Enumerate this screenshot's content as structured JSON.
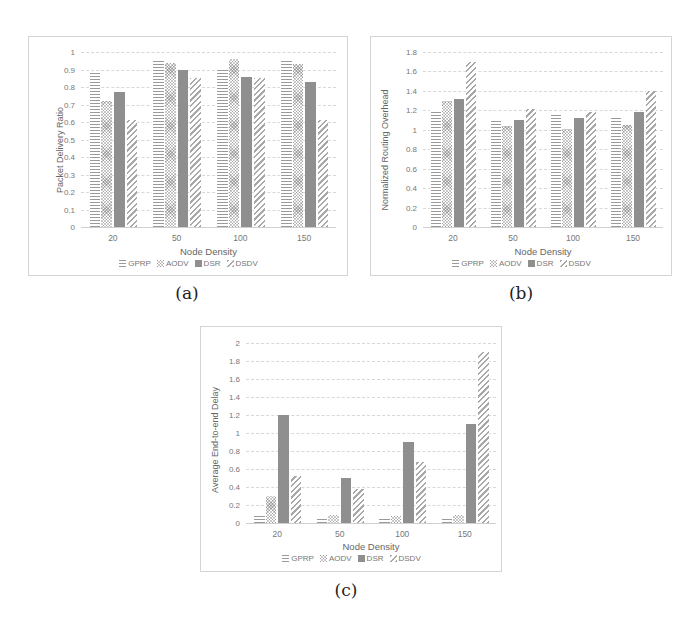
{
  "figure": {
    "captions": [
      "(a)",
      "(b)",
      "(c)"
    ]
  },
  "legend": {
    "items": [
      "GPRP",
      "AODV",
      "DSR",
      "DSDV"
    ]
  },
  "chart_data": [
    {
      "type": "bar",
      "title": "",
      "panel_label": "(a)",
      "xlabel": "Node Density",
      "ylabel": "Packet Delivery Ratio",
      "categories": [
        "20",
        "50",
        "100",
        "150"
      ],
      "ylim": [
        0,
        1
      ],
      "yticks": [
        "0",
        "0.1",
        "0.2",
        "0.3",
        "0.4",
        "0.5",
        "0.6",
        "0.7",
        "0.8",
        "0.9",
        "1"
      ],
      "grid": true,
      "legend_position": "bottom",
      "series": [
        {
          "name": "GPRP",
          "values": [
            0.89,
            0.95,
            0.91,
            0.95
          ]
        },
        {
          "name": "AODV",
          "values": [
            0.72,
            0.94,
            0.96,
            0.93
          ]
        },
        {
          "name": "DSR",
          "values": [
            0.77,
            0.9,
            0.86,
            0.83
          ]
        },
        {
          "name": "DSDV",
          "values": [
            0.61,
            0.85,
            0.85,
            0.61
          ]
        }
      ]
    },
    {
      "type": "bar",
      "title": "",
      "panel_label": "(b)",
      "xlabel": "Node Density",
      "ylabel": "Normalized Routing Overhead",
      "categories": [
        "20",
        "50",
        "100",
        "150"
      ],
      "ylim": [
        0,
        1.8
      ],
      "yticks": [
        "0",
        "0.2",
        "0.4",
        "0.6",
        "0.8",
        "1",
        "1.2",
        "1.4",
        "1.6",
        "1.8"
      ],
      "grid": true,
      "legend_position": "bottom",
      "series": [
        {
          "name": "GPRP",
          "values": [
            1.2,
            1.11,
            1.15,
            1.12
          ]
        },
        {
          "name": "AODV",
          "values": [
            1.3,
            1.04,
            1.01,
            1.05
          ]
        },
        {
          "name": "DSR",
          "values": [
            1.32,
            1.1,
            1.12,
            1.18
          ]
        },
        {
          "name": "DSDV",
          "values": [
            1.7,
            1.21,
            1.18,
            1.4
          ]
        }
      ]
    },
    {
      "type": "bar",
      "title": "",
      "panel_label": "(c)",
      "xlabel": "Node Density",
      "ylabel": "Average End-to-end Delay",
      "categories": [
        "20",
        "50",
        "100",
        "150"
      ],
      "ylim": [
        0,
        2
      ],
      "yticks": [
        "0",
        "0.2",
        "0.4",
        "0.6",
        "0.8",
        "1",
        "1.2",
        "1.4",
        "1.6",
        "1.8",
        "2"
      ],
      "grid": true,
      "legend_position": "bottom",
      "series": [
        {
          "name": "GPRP",
          "values": [
            0.08,
            0.07,
            0.07,
            0.07
          ]
        },
        {
          "name": "AODV",
          "values": [
            0.3,
            0.09,
            0.08,
            0.09
          ]
        },
        {
          "name": "DSR",
          "values": [
            1.2,
            0.5,
            0.9,
            1.1
          ]
        },
        {
          "name": "DSDV",
          "values": [
            0.52,
            0.38,
            0.68,
            1.9
          ]
        }
      ]
    }
  ]
}
